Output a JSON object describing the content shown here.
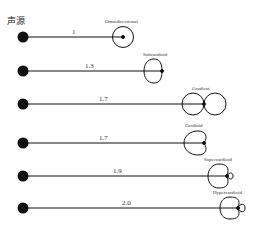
{
  "title": "声源",
  "rows": [
    {
      "ratio": "1",
      "pattern": "Omnidirectional"
    },
    {
      "ratio": "1.3",
      "pattern": "Subcardioid"
    },
    {
      "ratio": "1.7",
      "pattern": "Gradient"
    },
    {
      "ratio": "1.7",
      "pattern": "Cardioid"
    },
    {
      "ratio": "1.9",
      "pattern": "Supercardioid"
    },
    {
      "ratio": "2.0",
      "pattern": "Hypercardioid"
    }
  ],
  "colors": {
    "ink": "#111111",
    "background": "#ffffff"
  }
}
